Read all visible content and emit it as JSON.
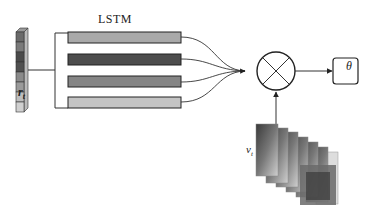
{
  "diagram": {
    "lstm_label": "LSTM",
    "input_vector_label": "r",
    "input_vector_subscript": "t",
    "video_label": "v",
    "video_subscript": "t",
    "output_label": "θ",
    "operator": "multiplication (⊗)",
    "input_cells": [
      "#6a6a6a",
      "#7a7a7a",
      "#4a4a4a",
      "#505050",
      "#8a8a8a",
      "#9a9a9a",
      "#bdbdbd",
      "#d0d0d0"
    ],
    "lstm_bars": [
      {
        "color": "#a9a9a9"
      },
      {
        "color": "#4d4d4d"
      },
      {
        "color": "#858585"
      },
      {
        "color": "#c4c4c4"
      }
    ],
    "video_frames_count": 7
  }
}
